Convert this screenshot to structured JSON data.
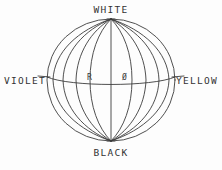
{
  "figure": {
    "type": "line-diagram",
    "background_color": "#fdfdfd",
    "line_color": "#3c3c3c",
    "text_color": "#333333"
  },
  "labels": {
    "top": "WHITE",
    "bottom": "BLACK",
    "left": "VIOLET",
    "right": "YELLOW",
    "inner_left": "R",
    "inner_right": "Ø"
  },
  "geometry": {
    "center_x": 111,
    "center_y": 80,
    "radius_x": 64,
    "radius_y": 61,
    "pole_top_y": 19,
    "pole_bottom_y": 141,
    "equator_y": 80,
    "meridian_count": 9,
    "equator_curve_depth": 7,
    "tick_extension": 9
  }
}
